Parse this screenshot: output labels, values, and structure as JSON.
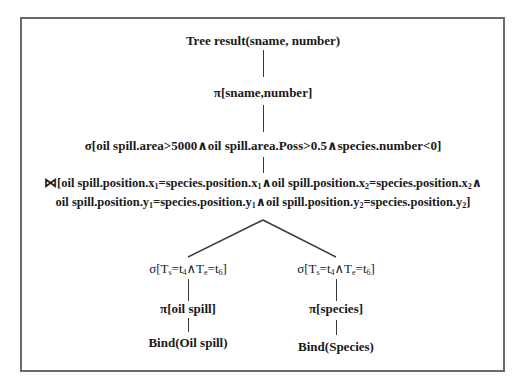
{
  "diagram": {
    "type": "relational-algebra-query-tree",
    "root": {
      "label": "Tree result(sname, number)"
    },
    "projection_top": {
      "symbol": "π",
      "label": "π[sname,number]"
    },
    "selection_top": {
      "symbol": "σ",
      "label": "σ[oil spill.area>5000∧oil spill.area.Poss>0.5∧species.number<0]"
    },
    "join": {
      "symbol": "⋈",
      "line1": {
        "prefix": "⋈[oil spill.position.x",
        "sub1": "1",
        "mid1": "=species.position.x",
        "sub2": "1",
        "mid2": "∧oil spill.position.x",
        "sub3": "2",
        "mid3": "=species.position.x",
        "sub4": "2",
        "suffix": "∧"
      },
      "line2": {
        "prefix": "oil spill.position.y",
        "sub1": "1",
        "mid1": "=species.position.y",
        "sub2": "1",
        "mid2": "∧oil spill.position.y",
        "sub3": "2",
        "mid3": "=species.position.y",
        "sub4": "2",
        "suffix": "]"
      }
    },
    "left_branch": {
      "selection": {
        "prefix": "σ[T",
        "sub1": "s",
        "mid1": "=t",
        "sub2": "4",
        "mid2": "∧T",
        "sub3": "e",
        "mid3": "=t",
        "sub4": "6",
        "suffix": "]"
      },
      "projection": "π[oil spill]",
      "source": "Bind(Oil spill)"
    },
    "right_branch": {
      "selection": {
        "prefix": "σ[T",
        "sub1": "s",
        "mid1": "=t",
        "sub2": "4",
        "mid2": "∧T",
        "sub3": "e",
        "mid3": "=t",
        "sub4": "6",
        "suffix": "]"
      },
      "projection": "π[species]",
      "source": "Bind(Species)"
    }
  },
  "colors": {
    "frame": "#6a6a6a",
    "edge": "#3a3a3a",
    "text": "#1a1a1a",
    "background": "#ffffff"
  }
}
